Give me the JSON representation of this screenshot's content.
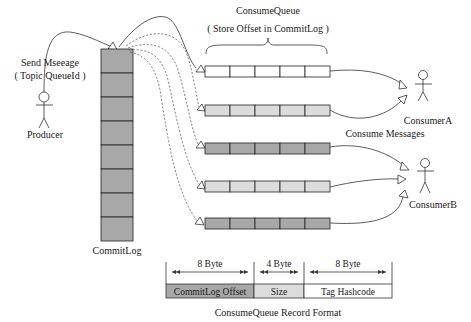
{
  "diagram": {
    "producer": {
      "label": "Producer",
      "action_line1": "Send Mseeage",
      "action_line2": "( Topic QueueId )"
    },
    "commitlog": {
      "label": "CommitLog",
      "cell_count": 8,
      "fill": "#a8a8a8"
    },
    "consumequeue": {
      "title": "ConsumeQueue",
      "subtitle": "( Store Offset in CommitLog )",
      "cells_per_queue": 5,
      "queues": [
        {
          "shade": "white",
          "fill": "#ffffff",
          "consumer": "ConsumerA"
        },
        {
          "shade": "light",
          "fill": "#dcdcdc",
          "consumer": "ConsumerA"
        },
        {
          "shade": "dark",
          "fill": "#a8a8a8",
          "consumer": "ConsumerB"
        },
        {
          "shade": "light",
          "fill": "#dcdcdc",
          "consumer": "ConsumerB"
        },
        {
          "shade": "dark",
          "fill": "#a8a8a8",
          "consumer": "ConsumerB"
        }
      ]
    },
    "consume_label": "Consume Messages",
    "consumers": [
      {
        "label": "ConsumerA"
      },
      {
        "label": "ConsumerB"
      }
    ],
    "record_format": {
      "title": "ConsumeQueue Record Format",
      "fields": [
        {
          "size": "8 Byte",
          "name": "CommitLog Offset",
          "fill": "#a8a8a8"
        },
        {
          "size": "4 Byte",
          "name": "Size",
          "fill": "#dcdcdc"
        },
        {
          "size": "8 Byte",
          "name": "Tag Hashcode",
          "fill": "#ffffff"
        }
      ]
    }
  }
}
